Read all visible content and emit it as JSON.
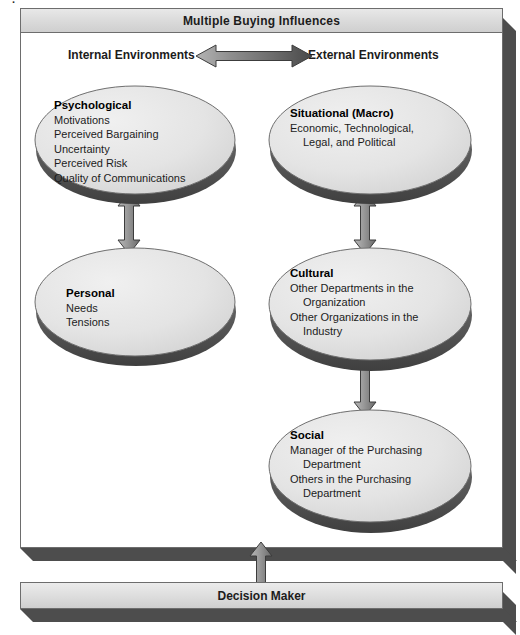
{
  "artifact": {
    "top_fragment": "."
  },
  "frame": {
    "title": "Multiple Buying Influences"
  },
  "columns": {
    "internal_heading": "Internal Environments",
    "external_heading": "External Environments"
  },
  "arrows": {
    "horizontal_label": "bidirectional-arrow",
    "psych_to_personal": "bidirectional-arrow",
    "situational_to_cultural": "bidirectional-arrow",
    "cultural_to_social": "bidirectional-arrow",
    "frame_to_decision": "bidirectional-arrow"
  },
  "discs": {
    "psychological": {
      "title": "Psychological",
      "lines": [
        "Motivations",
        "Perceived Bargaining",
        "Uncertainty",
        "Perceived Risk",
        "Quality of Communications"
      ]
    },
    "personal": {
      "title": "Personal",
      "lines": [
        "Needs",
        "Tensions"
      ]
    },
    "situational": {
      "title": "Situational (Macro)",
      "lines": [
        "Economic, Technological,",
        "Legal, and Political"
      ]
    },
    "cultural": {
      "title": "Cultural",
      "lines": [
        "Other Departments in the",
        "Organization",
        "Other Organizations in the",
        "Industry"
      ]
    },
    "social": {
      "title": "Social",
      "lines": [
        "Manager of the Purchasing",
        "Department",
        "Others in the Purchasing",
        "Department"
      ]
    }
  },
  "decision": {
    "label": "Decision Maker"
  },
  "colors": {
    "frame_fill": "#ffffff",
    "bar_fill": "#dcdcdc",
    "frame_shadow": "#4d4d4d",
    "disc_fill": "#e3e3e3",
    "disc_rim": "#5f5f5f",
    "arrow_fill": "#9a9a9a",
    "arrow_stroke": "#3c3c3c",
    "text": "#1c1c1c"
  }
}
